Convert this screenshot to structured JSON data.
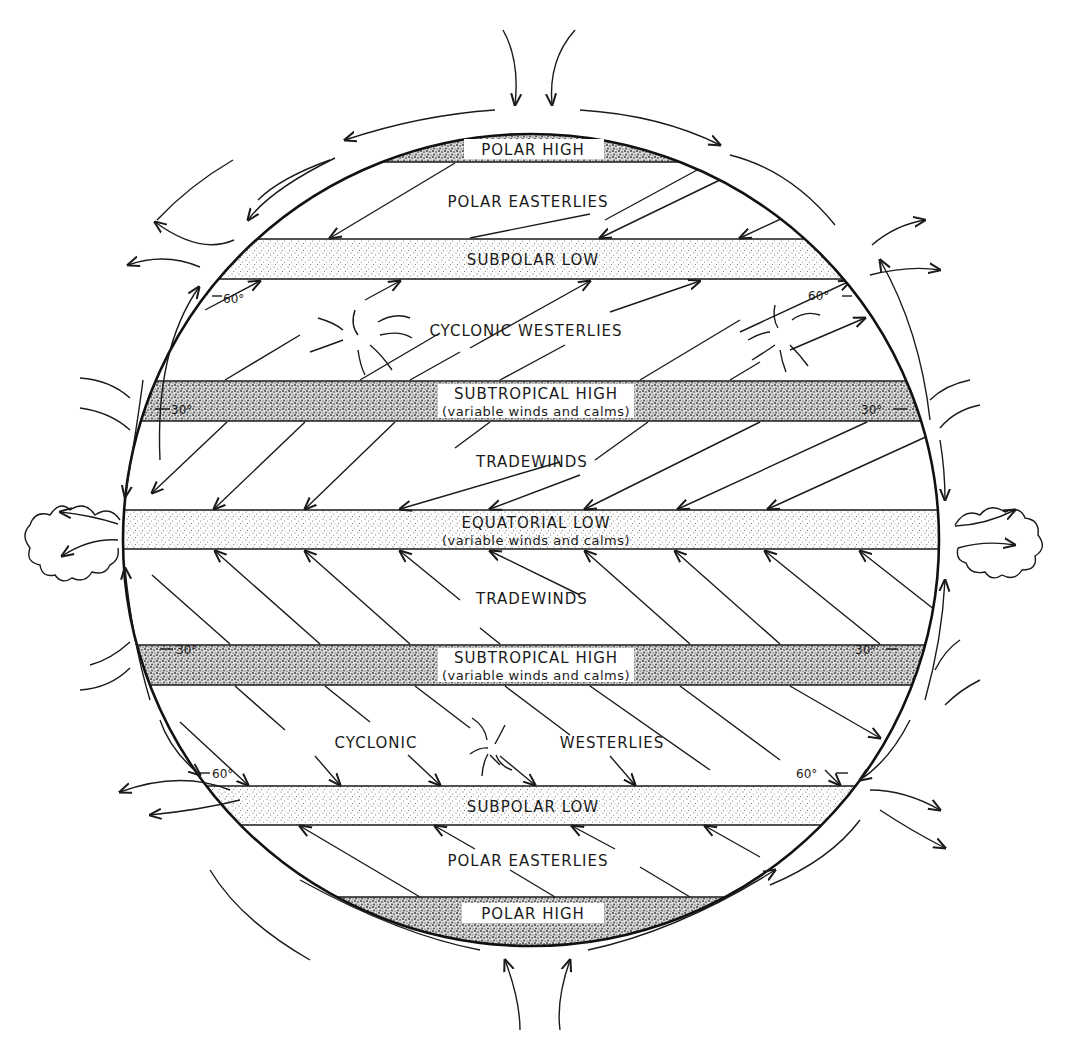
{
  "diagram": {
    "colors": {
      "ink": "#1a1a1a",
      "background": "#ffffff",
      "stipple_light": "#c9c9c9",
      "stipple_dark": "#8a8a8a"
    },
    "bands": [
      {
        "id": "polar-high-north",
        "label": "POLAR HIGH",
        "sublabel": "",
        "density": "dark"
      },
      {
        "id": "subpolar-low-north",
        "label": "SUBPOLAR LOW",
        "sublabel": "",
        "density": "light"
      },
      {
        "id": "subtropical-high-north",
        "label": "SUBTROPICAL HIGH",
        "sublabel": "(variable winds and calms)",
        "density": "dark"
      },
      {
        "id": "equatorial-low",
        "label": "EQUATORIAL LOW",
        "sublabel": "(variable winds and calms)",
        "density": "light"
      },
      {
        "id": "subtropical-high-south",
        "label": "SUBTROPICAL HIGH",
        "sublabel": "(variable winds and calms)",
        "density": "dark"
      },
      {
        "id": "subpolar-low-south",
        "label": "SUBPOLAR LOW",
        "sublabel": "",
        "density": "light"
      },
      {
        "id": "polar-high-south",
        "label": "POLAR HIGH",
        "sublabel": "",
        "density": "dark"
      }
    ],
    "wind_zones": [
      {
        "id": "polar-easterlies-north",
        "label": "POLAR EASTERLIES",
        "direction": "NE to SW"
      },
      {
        "id": "cyclonic-westerlies-north",
        "label": "CYCLONIC WESTERLIES",
        "direction": "SW to NE"
      },
      {
        "id": "tradewinds-north",
        "label": "TRADEWINDS",
        "direction": "NE to SW"
      },
      {
        "id": "tradewinds-south",
        "label": "TRADEWINDS",
        "direction": "SE to NW"
      },
      {
        "id": "cyclonic-westerlies-south-left",
        "label": "CYCLONIC",
        "direction": "NW to SE"
      },
      {
        "id": "cyclonic-westerlies-south-right",
        "label": "WESTERLIES",
        "direction": "NW to SE"
      },
      {
        "id": "polar-easterlies-south",
        "label": "POLAR EASTERLIES",
        "direction": "SE to NW"
      }
    ],
    "latitude_marks": {
      "n60_left": "60°",
      "n60_right": "60°",
      "n30_left": "30°",
      "n30_right": "30°",
      "s30_left": "30°",
      "s30_right": "30°",
      "s60_left": "60°",
      "s60_right": "60°"
    }
  }
}
